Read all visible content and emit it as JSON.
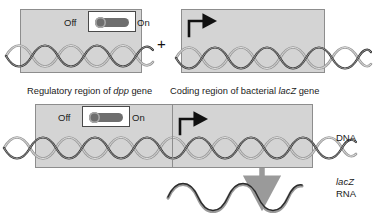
{
  "figure": {
    "plus_symbol": "+"
  },
  "panels": {
    "top_left": {
      "name": "regulatory-region-construct",
      "switch": {
        "off_label": "Off",
        "on_label": "On",
        "state": "on",
        "icon": "toggle-switch-icon"
      }
    },
    "top_right": {
      "name": "coding-region-construct",
      "promoter_arrow_icon": "transcription-start-arrow-icon"
    },
    "bottom": {
      "name": "fused-reporter-construct",
      "switch": {
        "off_label": "Off",
        "on_label": "On",
        "state": "on",
        "icon": "toggle-switch-icon"
      },
      "promoter_arrow_icon": "transcription-start-arrow-icon",
      "transcription_arrow_icon": "downward-transcription-arrow-icon"
    }
  },
  "labels": {
    "regulatory_region": {
      "prefix": "Regulatory region of ",
      "gene": "dpp",
      "suffix": " gene"
    },
    "coding_region": {
      "prefix": "Coding region of bacterial ",
      "gene": "lacZ",
      "suffix": " gene"
    },
    "dna": "DNA",
    "rna_gene": "lacZ",
    "rna": "RNA"
  },
  "colors": {
    "panel_fill": "#d4d4d4",
    "panel_border": "#8d8d8d",
    "dna_strand_dark": "#2b2b2b",
    "dna_strand_light": "#9a9a9a",
    "switch_lever": "#6e6e6e",
    "arrow_gray": "#9a9a9a",
    "text": "#1a1a1a"
  }
}
